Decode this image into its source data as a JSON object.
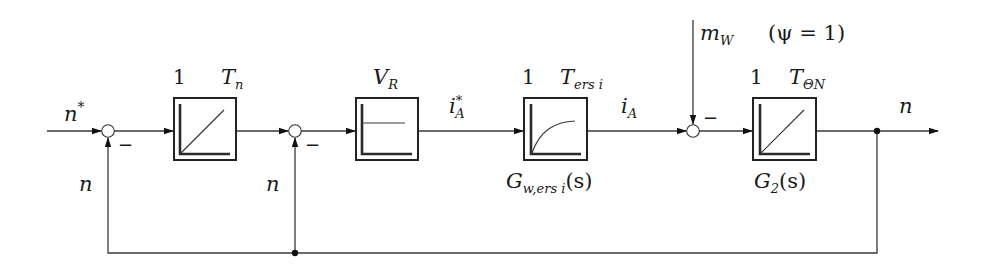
{
  "diagram": {
    "type": "control-block-diagram",
    "signals": {
      "input": {
        "base": "n",
        "sup": "*"
      },
      "feedback_outer": "n",
      "feedback_inner": "n",
      "current_ref": {
        "base": "i",
        "sup": "*",
        "sub": "A"
      },
      "current": {
        "base": "i",
        "sub": "A"
      },
      "disturbance": {
        "base": "m",
        "sub": "W"
      },
      "disturbance_note": "(ψ = 1)",
      "output": "n"
    },
    "blocks": [
      {
        "id": "speed-controller",
        "type": "integrator",
        "gain": "1",
        "time_const": {
          "base": "T",
          "sub": "n"
        },
        "transfer": null
      },
      {
        "id": "p-controller",
        "type": "proportional",
        "gain_label": {
          "base": "V",
          "sub": "R"
        },
        "transfer": null
      },
      {
        "id": "current-loop",
        "type": "pt1",
        "gain": "1",
        "time_const": {
          "base": "T",
          "sub": "ers i"
        },
        "transfer": {
          "base": "G",
          "sub": "w,ers i",
          "arg": "(s)"
        }
      },
      {
        "id": "plant",
        "type": "integrator",
        "gain": "1",
        "time_const": {
          "base": "T",
          "sub": "ΘN"
        },
        "transfer": {
          "base": "G",
          "sub": "2",
          "arg": "(s)"
        }
      }
    ],
    "summing_points": [
      {
        "id": "sum-1",
        "sign_feedback": "−"
      },
      {
        "id": "sum-2",
        "sign_feedback": "−"
      },
      {
        "id": "sum-3",
        "sign_disturbance": "−"
      }
    ]
  }
}
